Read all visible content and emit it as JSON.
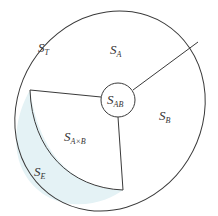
{
  "diagram": {
    "type": "set-partition",
    "colors": {
      "stroke": "#3a3a3a",
      "highlight_fill": "#e4f2f5",
      "background": "#ffffff",
      "text": "#333333"
    },
    "regions": [
      {
        "id": "total",
        "main": "S",
        "sub": "T",
        "description": "outer ellipse"
      },
      {
        "id": "a",
        "main": "S",
        "sub": "A"
      },
      {
        "id": "b",
        "main": "S",
        "sub": "B"
      },
      {
        "id": "ab",
        "main": "S",
        "sub": "AB",
        "description": "central circle"
      },
      {
        "id": "axb",
        "main": "S",
        "sub": "A×B"
      },
      {
        "id": "e",
        "main": "S",
        "sub": "E",
        "description": "shaded crescent"
      }
    ]
  }
}
